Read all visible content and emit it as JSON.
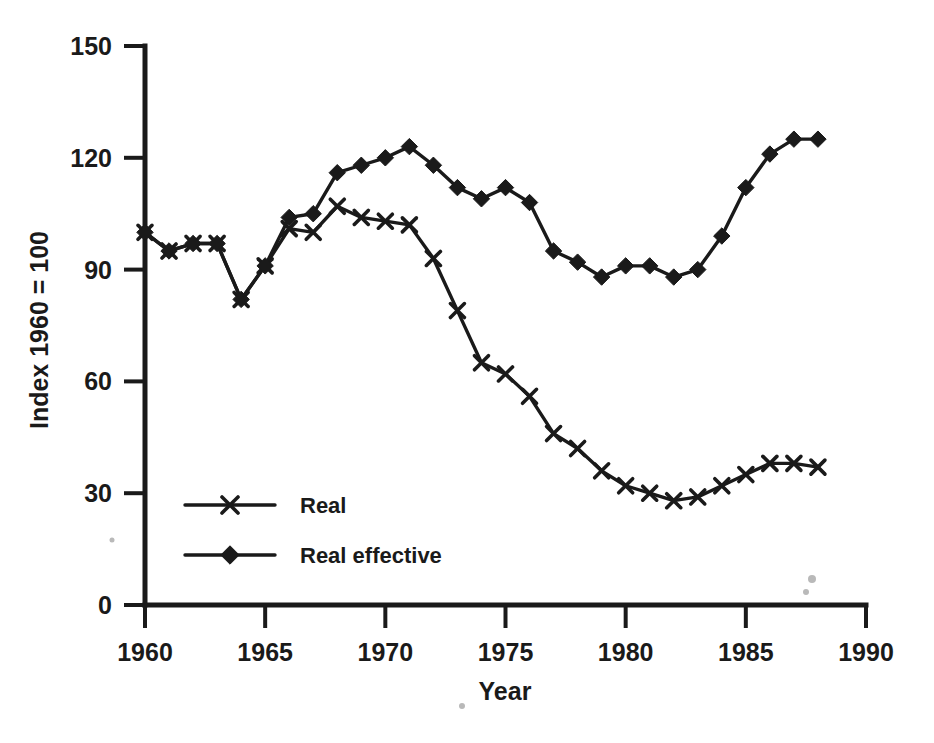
{
  "chart_data": {
    "type": "line",
    "title": "",
    "xlabel": "Year",
    "ylabel": "Index 1960 = 100",
    "xlim": [
      1960,
      1990
    ],
    "ylim": [
      0,
      150
    ],
    "xticks": [
      1960,
      1965,
      1970,
      1975,
      1980,
      1985,
      1990
    ],
    "xtick_labels": [
      "1960",
      "1965",
      "1970",
      "1975",
      "1980",
      "1985",
      "1990"
    ],
    "yticks": [
      0,
      30,
      60,
      90,
      120,
      150
    ],
    "ytick_labels": [
      "0",
      "30",
      "60",
      "90",
      "120",
      "150"
    ],
    "grid": false,
    "legend_position": "lower-left-inside",
    "x": [
      1960,
      1961,
      1962,
      1963,
      1964,
      1965,
      1966,
      1967,
      1968,
      1969,
      1970,
      1971,
      1972,
      1973,
      1974,
      1975,
      1976,
      1977,
      1978,
      1979,
      1980,
      1981,
      1982,
      1983,
      1984,
      1985,
      1986,
      1987,
      1988
    ],
    "series": [
      {
        "name": "Real",
        "marker": "x",
        "color": "#1a1a1a",
        "values": [
          100,
          95,
          97,
          97,
          82,
          91,
          101,
          100,
          107,
          104,
          103,
          102,
          93,
          79,
          65,
          62,
          56,
          46,
          42,
          36,
          32,
          30,
          28,
          29,
          32,
          35,
          38,
          38,
          37
        ]
      },
      {
        "name": "Real effective",
        "marker": "diamond",
        "color": "#1a1a1a",
        "values": [
          100,
          95,
          97,
          97,
          82,
          91,
          104,
          105,
          116,
          118,
          120,
          123,
          118,
          112,
          109,
          112,
          108,
          95,
          92,
          88,
          91,
          91,
          88,
          90,
          99,
          112,
          121,
          125,
          125
        ]
      }
    ],
    "legend": [
      {
        "label": "Real",
        "marker": "x"
      },
      {
        "label": "Real effective",
        "marker": "diamond"
      }
    ]
  }
}
